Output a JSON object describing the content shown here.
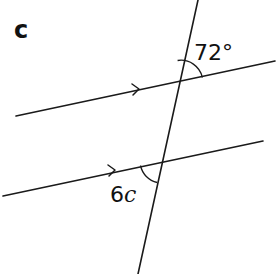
{
  "part_label": "c",
  "angles": {
    "given": {
      "value": "72°",
      "position": "upper intersection, between transversal (upward) and parallel line (rightward)"
    },
    "unknown": {
      "coefficient": "6",
      "variable": "c",
      "position": "lower intersection, between parallel line (leftward) and transversal (downward)"
    }
  },
  "lines": {
    "transversal": {
      "from": [
        198,
        0
      ],
      "to": [
        138,
        274
      ]
    },
    "upper_parallel": {
      "from": [
        16,
        116
      ],
      "to": [
        275,
        61
      ],
      "arrow_at": [
        137,
        89
      ]
    },
    "lower_parallel": {
      "from": [
        3,
        196
      ],
      "to": [
        263,
        141
      ],
      "arrow_at": [
        114,
        170
      ]
    }
  },
  "colors": {
    "stroke": "#1a1a1a",
    "background": "#ffffff"
  }
}
